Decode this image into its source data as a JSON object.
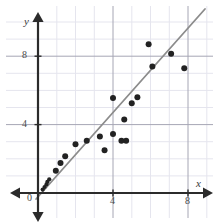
{
  "chart_data": {
    "type": "scatter",
    "title": "",
    "xlabel": "x",
    "ylabel": "y",
    "xlim": [
      -0.6,
      9.4
    ],
    "ylim": [
      -0.5,
      10.6
    ],
    "grid": true,
    "legend": null,
    "x_ticks": [
      4,
      8
    ],
    "y_ticks": [
      4,
      8
    ],
    "origin_label": "0",
    "minor_grid_step": 1,
    "points": [
      {
        "x": 0.25,
        "y": 0.2
      },
      {
        "x": 0.35,
        "y": 0.35
      },
      {
        "x": 0.45,
        "y": 0.5
      },
      {
        "x": 0.5,
        "y": 0.65
      },
      {
        "x": 0.6,
        "y": 0.8
      },
      {
        "x": 0.95,
        "y": 1.3
      },
      {
        "x": 1.2,
        "y": 1.75
      },
      {
        "x": 1.45,
        "y": 2.15
      },
      {
        "x": 2.0,
        "y": 2.85
      },
      {
        "x": 2.6,
        "y": 3.05
      },
      {
        "x": 3.3,
        "y": 3.3
      },
      {
        "x": 3.55,
        "y": 2.5
      },
      {
        "x": 4.0,
        "y": 3.45
      },
      {
        "x": 4.0,
        "y": 5.55
      },
      {
        "x": 4.45,
        "y": 3.05
      },
      {
        "x": 4.7,
        "y": 3.05
      },
      {
        "x": 4.6,
        "y": 4.3
      },
      {
        "x": 5.0,
        "y": 5.25
      },
      {
        "x": 5.3,
        "y": 5.6
      },
      {
        "x": 5.9,
        "y": 8.7
      },
      {
        "x": 6.1,
        "y": 7.4
      },
      {
        "x": 7.1,
        "y": 8.15
      },
      {
        "x": 7.8,
        "y": 7.3
      }
    ],
    "trend_line": {
      "label": "line of best fit",
      "slope": 1.12,
      "intercept": -0.35,
      "x_start": -0.1,
      "x_end": 8.9,
      "color": "#8c8c8c"
    },
    "colors": {
      "point": "#222222",
      "axis": "#2b2b2b",
      "grid_minor": "#e3e3ec",
      "grid_major": "#9a9aa8",
      "trend": "#8c8c8c",
      "text": "#3a3a3a"
    }
  }
}
